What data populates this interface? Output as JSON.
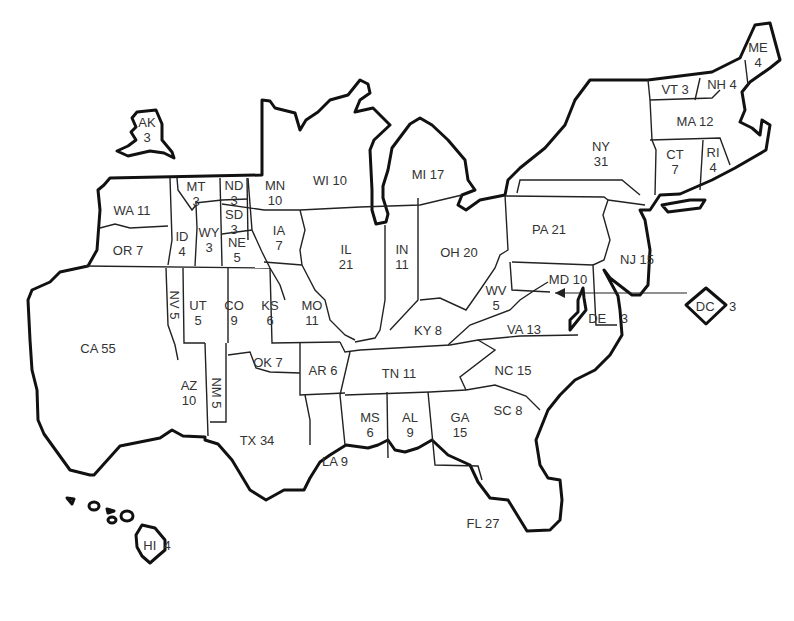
{
  "map": {
    "title": "US Electoral Votes Cartogram",
    "states": [
      {
        "abbr": "AK",
        "votes": "3",
        "stacked": true
      },
      {
        "abbr": "WA",
        "votes": "11"
      },
      {
        "abbr": "OR",
        "votes": "7"
      },
      {
        "abbr": "CA",
        "votes": "55"
      },
      {
        "abbr": "ID",
        "votes": "4",
        "stacked": true
      },
      {
        "abbr": "MT",
        "votes": "3",
        "stacked": true
      },
      {
        "abbr": "WY",
        "votes": "3",
        "stacked": true
      },
      {
        "abbr": "ND",
        "votes": "3",
        "stacked": true
      },
      {
        "abbr": "SD",
        "votes": "3",
        "stacked": true
      },
      {
        "abbr": "NE",
        "votes": "5",
        "stacked": true
      },
      {
        "abbr": "NV",
        "votes": "5"
      },
      {
        "abbr": "UT",
        "votes": "5",
        "stacked": true
      },
      {
        "abbr": "CO",
        "votes": "9",
        "stacked": true
      },
      {
        "abbr": "KS",
        "votes": "6",
        "stacked": true
      },
      {
        "abbr": "AZ",
        "votes": "10",
        "stacked": true
      },
      {
        "abbr": "NM",
        "votes": "5"
      },
      {
        "abbr": "OK",
        "votes": "7"
      },
      {
        "abbr": "TX",
        "votes": "34"
      },
      {
        "abbr": "MN",
        "votes": "10",
        "stacked": true
      },
      {
        "abbr": "IA",
        "votes": "7",
        "stacked": true
      },
      {
        "abbr": "MO",
        "votes": "11",
        "stacked": true
      },
      {
        "abbr": "AR",
        "votes": "6"
      },
      {
        "abbr": "LA",
        "votes": "9"
      },
      {
        "abbr": "WI",
        "votes": "10"
      },
      {
        "abbr": "IL",
        "votes": "21",
        "stacked": true
      },
      {
        "abbr": "MI",
        "votes": "17"
      },
      {
        "abbr": "IN",
        "votes": "11",
        "stacked": true
      },
      {
        "abbr": "OH",
        "votes": "20"
      },
      {
        "abbr": "KY",
        "votes": "8"
      },
      {
        "abbr": "TN",
        "votes": "11"
      },
      {
        "abbr": "MS",
        "votes": "6",
        "stacked": true
      },
      {
        "abbr": "AL",
        "votes": "9",
        "stacked": true
      },
      {
        "abbr": "GA",
        "votes": "15",
        "stacked": true
      },
      {
        "abbr": "FL",
        "votes": "27"
      },
      {
        "abbr": "SC",
        "votes": "8"
      },
      {
        "abbr": "NC",
        "votes": "15"
      },
      {
        "abbr": "VA",
        "votes": "13"
      },
      {
        "abbr": "WV",
        "votes": "5",
        "stacked": true
      },
      {
        "abbr": "PA",
        "votes": "21"
      },
      {
        "abbr": "MD",
        "votes": "10"
      },
      {
        "abbr": "DE",
        "votes": "3"
      },
      {
        "abbr": "NJ",
        "votes": "15"
      },
      {
        "abbr": "NY",
        "votes": "31",
        "stacked": true
      },
      {
        "abbr": "CT",
        "votes": "7",
        "stacked": true
      },
      {
        "abbr": "RI",
        "votes": "4",
        "stacked": true
      },
      {
        "abbr": "MA",
        "votes": "12"
      },
      {
        "abbr": "VT",
        "votes": "3"
      },
      {
        "abbr": "NH",
        "votes": "4"
      },
      {
        "abbr": "ME",
        "votes": "4",
        "stacked": true
      },
      {
        "abbr": "DC",
        "votes": "3"
      },
      {
        "abbr": "HI",
        "votes": "4"
      }
    ]
  }
}
